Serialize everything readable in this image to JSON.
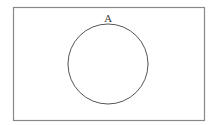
{
  "diagram": {
    "type": "venn",
    "universe": {
      "label": "",
      "stroke": "#777777"
    },
    "sets": [
      {
        "label": "A",
        "stroke": "#555555",
        "fill": "none"
      }
    ]
  }
}
